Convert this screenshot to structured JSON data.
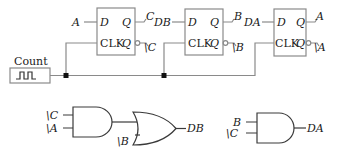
{
  "diagram": {
    "type": "sequential-logic-circuit",
    "clock": {
      "label": "Count"
    },
    "flip_flops": [
      {
        "id": "ff-c",
        "d_input": "A",
        "d_label": "D",
        "clk_label": "CLK",
        "q_label": "Q",
        "q_out": "C",
        "qbar_label": "Q",
        "qbar_out": "\\C"
      },
      {
        "id": "ff-b",
        "d_input": "DB",
        "d_label": "D",
        "clk_label": "CLK",
        "q_label": "Q",
        "q_out": "B",
        "qbar_label": "Q",
        "qbar_out": "\\B"
      },
      {
        "id": "ff-a",
        "d_input": "DA",
        "d_label": "D",
        "clk_label": "CLK",
        "q_label": "Q",
        "q_out": "A",
        "qbar_label": "Q",
        "qbar_out": "\\A"
      }
    ],
    "gates": [
      {
        "id": "and-1",
        "type": "AND",
        "inputs": [
          "\\C",
          "\\A"
        ]
      },
      {
        "id": "or-1",
        "type": "OR",
        "inputs": [
          "and-1",
          "\\B"
        ],
        "output": "DB"
      },
      {
        "id": "and-2",
        "type": "AND",
        "inputs": [
          "B",
          "\\C"
        ],
        "output": "DA"
      }
    ]
  }
}
